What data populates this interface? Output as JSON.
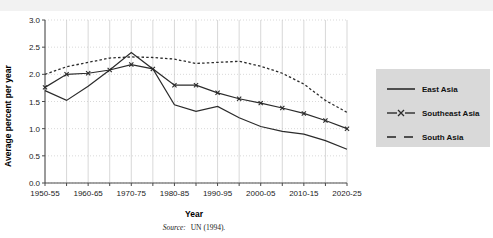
{
  "figure": {
    "source_note_prefix": "Source:",
    "source_note": "UN (1994)."
  },
  "legend": {
    "position": "right",
    "items": [
      {
        "label": "East Asia",
        "style": "solid",
        "marker": "none"
      },
      {
        "label": "Southeast Asia",
        "style": "solid",
        "marker": "x"
      },
      {
        "label": "South Asia",
        "style": "dashed",
        "marker": "none"
      }
    ]
  },
  "chart_data": {
    "type": "line",
    "title": "",
    "xlabel": "Year",
    "ylabel": "Average percent per year",
    "ylim": [
      0.0,
      3.0
    ],
    "yticks": [
      "0.0",
      "0.5",
      "1.0",
      "1.5",
      "2.0",
      "2.5",
      "3.0"
    ],
    "ytick_values": [
      0.0,
      0.5,
      1.0,
      1.5,
      2.0,
      2.5,
      3.0
    ],
    "grid": true,
    "legend_position": "right",
    "categories": [
      "1950-55",
      "1955-60",
      "1960-65",
      "1965-70",
      "1970-75",
      "1975-80",
      "1980-85",
      "1985-90",
      "1990-95",
      "1995-00",
      "2000-05",
      "2005-10",
      "2010-15",
      "2015-20",
      "2020-25"
    ],
    "xtick_labels": [
      "1950-55",
      "",
      "1960-65",
      "",
      "1970-75",
      "",
      "1980-85",
      "",
      "1990-95",
      "",
      "2000-05",
      "",
      "2010-15",
      "",
      "2020-25"
    ],
    "series": [
      {
        "name": "East Asia",
        "values": [
          1.7,
          1.52,
          1.78,
          2.08,
          2.4,
          2.1,
          1.44,
          1.32,
          1.41,
          1.2,
          1.04,
          0.95,
          0.9,
          0.78,
          0.62
        ]
      },
      {
        "name": "Southeast Asia",
        "values": [
          1.76,
          2.0,
          2.02,
          2.08,
          2.18,
          2.1,
          1.8,
          1.8,
          1.66,
          1.55,
          1.47,
          1.38,
          1.28,
          1.15,
          1.0
        ]
      },
      {
        "name": "South Asia",
        "values": [
          2.0,
          2.14,
          2.22,
          2.3,
          2.32,
          2.31,
          2.28,
          2.2,
          2.22,
          2.24,
          2.15,
          2.02,
          1.82,
          1.52,
          1.3
        ]
      }
    ]
  }
}
